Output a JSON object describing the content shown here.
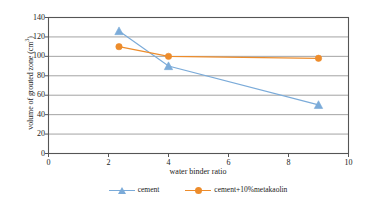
{
  "chart_data": {
    "type": "line",
    "title": "",
    "xlabel": "water binder ratio",
    "ylabel": "volume of grouted zone (cm3)",
    "ylabel_main": "volume of grouted zone (cm",
    "ylabel_sup": "3",
    "ylabel_tail": ")",
    "xlim": [
      0,
      10
    ],
    "ylim": [
      0,
      140
    ],
    "xticks": [
      0,
      2,
      4,
      6,
      8,
      10
    ],
    "yticks": [
      0,
      20,
      40,
      60,
      80,
      100,
      120,
      140
    ],
    "grid": "horizontal",
    "legend_position": "bottom",
    "series": [
      {
        "name": "cement",
        "color": "#7babd9",
        "marker": "triangle",
        "x": [
          2.35,
          4.0,
          9.0
        ],
        "values": [
          126,
          90,
          50
        ]
      },
      {
        "name": "cement+10%metakaolin",
        "color": "#ed8c2b",
        "marker": "circle",
        "x": [
          2.35,
          4.0,
          9.0
        ],
        "values": [
          110,
          100,
          98
        ]
      }
    ]
  },
  "axes": {
    "frame_color": "#555555",
    "grid_color": "#8c8c8c"
  }
}
